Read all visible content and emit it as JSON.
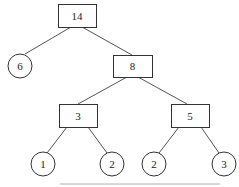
{
  "diagram": {
    "type": "tree",
    "nodes": [
      {
        "id": "n14",
        "label": "14",
        "shape": "rect",
        "x": 58,
        "y": 4,
        "w": 38,
        "h": 23
      },
      {
        "id": "n6",
        "label": "6",
        "shape": "circle",
        "cx": 20,
        "cy": 66,
        "r": 12
      },
      {
        "id": "n8",
        "label": "8",
        "shape": "rect",
        "x": 113,
        "y": 55,
        "w": 39,
        "h": 22
      },
      {
        "id": "n3",
        "label": "3",
        "shape": "rect",
        "x": 59,
        "y": 104,
        "w": 38,
        "h": 23
      },
      {
        "id": "n5",
        "label": "5",
        "shape": "rect",
        "x": 171,
        "y": 104,
        "w": 38,
        "h": 23
      },
      {
        "id": "n1",
        "label": "1",
        "shape": "circle",
        "cx": 43,
        "cy": 164,
        "r": 12
      },
      {
        "id": "n2a",
        "label": "2",
        "shape": "circle",
        "cx": 112,
        "cy": 164,
        "r": 12
      },
      {
        "id": "n2b",
        "label": "2",
        "shape": "circle",
        "cx": 154,
        "cy": 164,
        "r": 12
      },
      {
        "id": "n3b",
        "label": "3",
        "shape": "circle",
        "cx": 224,
        "cy": 164,
        "r": 12
      }
    ],
    "edges": [
      {
        "from": "n14",
        "to": "n6",
        "x1": 71,
        "y1": 27,
        "x2": 25,
        "y2": 54
      },
      {
        "from": "n14",
        "to": "n8",
        "x1": 82,
        "y1": 27,
        "x2": 132,
        "y2": 55
      },
      {
        "from": "n8",
        "to": "n3",
        "x1": 127,
        "y1": 77,
        "x2": 78,
        "y2": 104
      },
      {
        "from": "n8",
        "to": "n5",
        "x1": 138,
        "y1": 77,
        "x2": 187,
        "y2": 104
      },
      {
        "from": "n3",
        "to": "n1",
        "x1": 67,
        "y1": 127,
        "x2": 47,
        "y2": 153
      },
      {
        "from": "n3",
        "to": "n2a",
        "x1": 88,
        "y1": 127,
        "x2": 107,
        "y2": 153
      },
      {
        "from": "n5",
        "to": "n2b",
        "x1": 179,
        "y1": 127,
        "x2": 159,
        "y2": 153
      },
      {
        "from": "n5",
        "to": "n3b",
        "x1": 201,
        "y1": 127,
        "x2": 219,
        "y2": 153
      }
    ]
  }
}
